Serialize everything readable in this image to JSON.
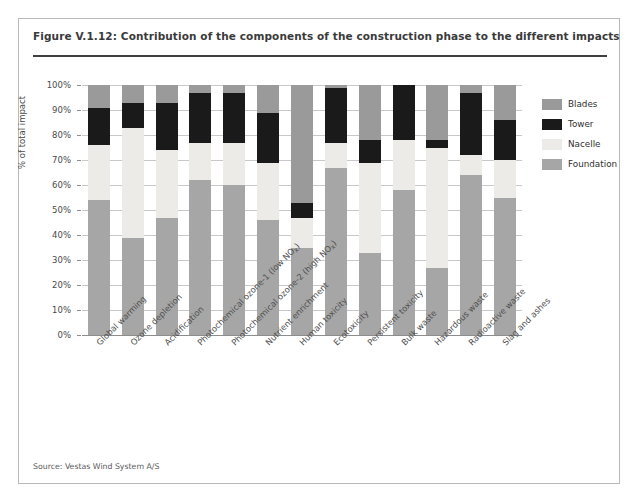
{
  "figure": {
    "title": "Figure V.1.12: Contribution of the components of the construction phase to the different impacts",
    "source": "Source: Vestas Wind System A/S"
  },
  "colors": {
    "blades": "#9a9a9a",
    "tower": "#1a1a1a",
    "nacelle": "#ecebe7",
    "foundation": "#a6a6a6",
    "gridline": "#c8c8c8",
    "axis": "#8d8d8d",
    "title_rule": "#3f3f3f",
    "frame": "#b9b9b9"
  },
  "legend": {
    "position": "right",
    "items": [
      {
        "label": "Blades",
        "color": "#9a9a9a",
        "key": "blades"
      },
      {
        "label": "Tower",
        "color": "#1a1a1a",
        "key": "tower"
      },
      {
        "label": "Nacelle",
        "color": "#ecebe7",
        "key": "nacelle"
      },
      {
        "label": "Foundation",
        "color": "#a6a6a6",
        "key": "foundation"
      }
    ]
  },
  "chart_data": {
    "type": "bar",
    "stacked": true,
    "title": "Contribution of the components of the construction phase to the different impacts",
    "xlabel": "",
    "ylabel": "% of total impact",
    "ylim": [
      0,
      100
    ],
    "yticks": [
      "0%",
      "10%",
      "20%",
      "30%",
      "40%",
      "50%",
      "60%",
      "70%",
      "80%",
      "90%",
      "100%"
    ],
    "ytick_values": [
      0,
      10,
      20,
      30,
      40,
      50,
      60,
      70,
      80,
      90,
      100
    ],
    "grid": true,
    "legend_position": "right",
    "categories": [
      "Global warming",
      "Ozone depletion",
      "Acidification",
      "Photochemical ozone-1 (low NOx)",
      "Photochemical ozone-2 (high NOx)",
      "Nutrient enrichment",
      "Human toxicity",
      "Ecotoxicity",
      "Persistent toxicity",
      "Bulk waste",
      "Hazardous waste",
      "Radioactive waste",
      "Slag and ashes"
    ],
    "categories_rich": [
      {
        "pre": "Global warming",
        "sub": "",
        "post": ""
      },
      {
        "pre": "Ozone depletion",
        "sub": "",
        "post": ""
      },
      {
        "pre": "Acidification",
        "sub": "",
        "post": ""
      },
      {
        "pre": "Photochemical ozone-1 (low NO",
        "sub": "x",
        "post": ")"
      },
      {
        "pre": "Photochemical ozone-2 (high NO",
        "sub": "x",
        "post": ")"
      },
      {
        "pre": "Nutrient enrichment",
        "sub": "",
        "post": ""
      },
      {
        "pre": "Human toxicity",
        "sub": "",
        "post": ""
      },
      {
        "pre": "Ecotoxicity",
        "sub": "",
        "post": ""
      },
      {
        "pre": "Persistent toxicity",
        "sub": "",
        "post": ""
      },
      {
        "pre": "Bulk waste",
        "sub": "",
        "post": ""
      },
      {
        "pre": "Hazardous waste",
        "sub": "",
        "post": ""
      },
      {
        "pre": "Radioactive waste",
        "sub": "",
        "post": ""
      },
      {
        "pre": "Slag and ashes",
        "sub": "",
        "post": ""
      }
    ],
    "stack_order_bottom_to_top": [
      "foundation",
      "nacelle",
      "tower",
      "blades"
    ],
    "series": [
      {
        "name": "Foundation",
        "color": "#a6a6a6",
        "values": [
          54,
          39,
          47,
          62,
          60,
          46,
          35,
          67,
          33,
          58,
          27,
          64,
          55
        ]
      },
      {
        "name": "Nacelle",
        "color": "#ecebe7",
        "values": [
          22,
          44,
          27,
          15,
          17,
          23,
          12,
          10,
          36,
          20,
          48,
          8,
          15
        ]
      },
      {
        "name": "Tower",
        "color": "#1a1a1a",
        "values": [
          15,
          10,
          19,
          20,
          20,
          20,
          6,
          22,
          9,
          22,
          3,
          25,
          16
        ]
      },
      {
        "name": "Blades",
        "color": "#9a9a9a",
        "values": [
          9,
          7,
          7,
          3,
          3,
          11,
          47,
          1,
          22,
          0,
          22,
          3,
          14
        ]
      }
    ]
  }
}
